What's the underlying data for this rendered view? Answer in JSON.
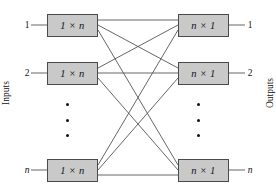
{
  "figure": {
    "side_labels": {
      "left": "Inputs",
      "right": "Outputs"
    },
    "colors": {
      "box_fill": "#c9c9c9",
      "box_stroke": "#4a4a4a",
      "wire": "#555555",
      "text": "#111111",
      "background": "#ffffff"
    },
    "input_stage": {
      "box_label": "1 × n",
      "ellipsis_glyph": "vertical-ellipsis",
      "boxes": [
        {
          "port": "1",
          "label": "1 × n"
        },
        {
          "port": "2",
          "label": "1 × n"
        },
        {
          "port": "n",
          "label": "1 × n"
        }
      ]
    },
    "output_stage": {
      "box_label": "n × 1",
      "ellipsis_glyph": "vertical-ellipsis",
      "boxes": [
        {
          "port": "1",
          "label": "n × 1"
        },
        {
          "port": "2",
          "label": "n × 1"
        },
        {
          "port": "n",
          "label": "n × 1"
        }
      ]
    },
    "connections": {
      "description": "full mesh from each 1 × n demultiplexer to each n × 1 multiplexer",
      "count": 9,
      "pairs": [
        [
          1,
          1
        ],
        [
          1,
          2
        ],
        [
          1,
          3
        ],
        [
          2,
          1
        ],
        [
          2,
          2
        ],
        [
          2,
          3
        ],
        [
          3,
          1
        ],
        [
          3,
          2
        ],
        [
          3,
          3
        ]
      ]
    },
    "geometry": {
      "input_box_right_x": 98,
      "output_box_left_x": 178,
      "row_centers_y": [
        25,
        73,
        170
      ]
    }
  }
}
